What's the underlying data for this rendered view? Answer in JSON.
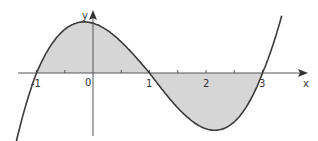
{
  "graph": {
    "x_axis_label": "x",
    "y_axis_label": "y",
    "origin_label": "0",
    "x_tick_labels": [
      {
        "value": -1,
        "text": "-1"
      },
      {
        "value": 1,
        "text": "1"
      },
      {
        "value": 2,
        "text": "2"
      },
      {
        "value": 3,
        "text": "3"
      }
    ],
    "function": "y = k(x+1)(x-1)(x-3)",
    "roots": [
      -1,
      1,
      3
    ],
    "shaded_regions": [
      {
        "from": -1,
        "to": 1,
        "side": "above x-axis"
      },
      {
        "from": 1,
        "to": 3,
        "side": "below x-axis"
      }
    ],
    "colors": {
      "curve": "#3a3a3a",
      "shade": "#d6d6d6",
      "axis": "#555555"
    }
  },
  "chart_data": {
    "type": "line",
    "title": "",
    "xlabel": "x",
    "ylabel": "y",
    "x": [
      -1.4,
      -1,
      -0.5,
      0,
      0.5,
      1,
      1.5,
      2,
      2.5,
      3,
      3.35
    ],
    "series": [
      {
        "name": "curve",
        "values": [
          -1.1,
          0,
          0.79,
          0.9,
          0.53,
          0,
          -0.59,
          -0.9,
          -0.66,
          0,
          1.08
        ]
      }
    ],
    "xlim": [
      -1.4,
      3.6
    ],
    "grid": false,
    "annotations": [
      "shaded area between curve and x-axis from x=-1 to x=3"
    ]
  }
}
